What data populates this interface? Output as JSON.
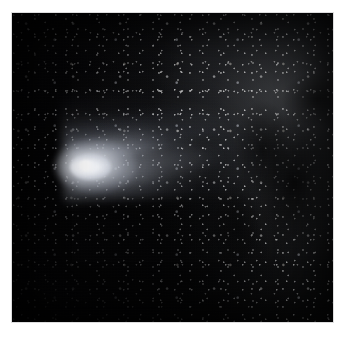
{
  "image": {
    "subject": "comet",
    "title": "Comet with broad dust tail over dense star field",
    "medium": "black-and-white astrophotograph",
    "orientation": "square",
    "frame": {
      "width_px": 345,
      "height_px": 338,
      "margin_color": "#ffffff",
      "plate_left_px": 12,
      "plate_top_px": 13,
      "plate_width_px": 321,
      "plate_height_px": 309
    },
    "palette": {
      "background_black": "#050506",
      "deep_shadow": "#020203",
      "nebula_gray": "#56585c",
      "star_white": "#ffffff",
      "tail_gray": "#b4bac8",
      "nucleus_white": "#ffffff",
      "page_white": "#fefefe"
    },
    "features": [
      {
        "name": "comet-nucleus",
        "label": "Comet nucleus",
        "description": "Intensely bright compact core, near pure white",
        "center_x_pct": 23,
        "center_y_pct": 49,
        "brightness": "maximum"
      },
      {
        "name": "comet-coma",
        "label": "Coma",
        "description": "Soft glowing envelope surrounding the nucleus, teardrop shaped",
        "center_x_pct": 26,
        "center_y_pct": 49,
        "brightness": "very high"
      },
      {
        "name": "comet-dust-tail",
        "label": "Dust tail",
        "description": "Wide fan of dust sweeping up and to the right, fading into the star field",
        "direction": "upper-right",
        "span_x_pct": [
          24,
          95
        ],
        "span_y_pct": [
          20,
          62
        ],
        "brightness": "moderate, falling off with distance"
      },
      {
        "name": "tail-ray-upper",
        "label": "Upper tail ray",
        "description": "Narrow brighter streamer along the top edge of the fan",
        "brightness": "moderate"
      },
      {
        "name": "tail-ray-lower",
        "label": "Lower tail ray",
        "description": "Fainter streamer below the main tail axis",
        "brightness": "low"
      },
      {
        "name": "milky-way-star-field",
        "label": "Dense star field",
        "description": "Thousands of unresolved stars thickening toward the right and upper right",
        "brightness": "low, granular"
      },
      {
        "name": "dark-nebula-lanes",
        "label": "Dark nebula lanes",
        "description": "Patchy obscuring dust clouds cutting through the star field on the right",
        "brightness": "near black"
      },
      {
        "name": "empty-sky-lower-left",
        "label": "Sparse lower-left sky",
        "description": "Almost featureless black region with only scattered faint stars",
        "brightness": "minimum"
      }
    ]
  }
}
